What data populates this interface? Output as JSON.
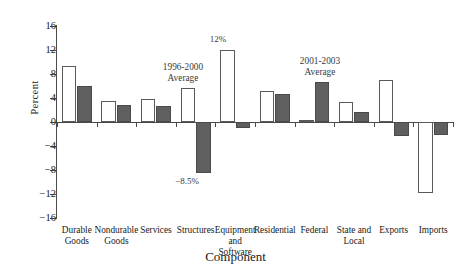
{
  "chart_data": {
    "type": "bar",
    "title": "",
    "xlabel": "Component",
    "ylabel": "Percent",
    "ylim": [
      -16,
      16
    ],
    "yticks": [
      16,
      12,
      8,
      4,
      0,
      -4,
      -8,
      -12,
      -16
    ],
    "ytick_labels": [
      "16",
      "12",
      "8",
      "4",
      "0",
      "−4",
      "−8",
      "−12",
      "−16"
    ],
    "grid": false,
    "legend": "none (series identified by in-plot annotations)",
    "categories": [
      "Durable Goods",
      "Nondurable Goods",
      "Services",
      "Structures",
      "Equipment and Software",
      "Residential",
      "Federal",
      "State and Local",
      "Exports",
      "Imports"
    ],
    "category_lines": [
      [
        "Durable",
        "Goods"
      ],
      [
        "Nondurable",
        "Goods"
      ],
      [
        "Services"
      ],
      [
        "Structures"
      ],
      [
        "Equipment",
        "and",
        "Software"
      ],
      [
        "Residential"
      ],
      [
        "Federal"
      ],
      [
        "State and",
        "Local"
      ],
      [
        "Exports"
      ],
      [
        "Imports"
      ]
    ],
    "series": [
      {
        "name": "1996-2000 Average",
        "style": "white-filled outlined bar",
        "color": "#ffffff",
        "edge_color": "#5a5a5a",
        "values": [
          9.3,
          3.5,
          3.9,
          5.6,
          12.0,
          5.2,
          0.3,
          3.4,
          7.0,
          -11.8
        ]
      },
      {
        "name": "2001-2003 Average",
        "style": "dark gray filled bar",
        "color": "#5f5f5f",
        "edge_color": "#4a4a4a",
        "values": [
          6.0,
          2.8,
          2.6,
          -8.5,
          -1.0,
          4.7,
          6.7,
          1.7,
          -2.4,
          -2.2
        ]
      }
    ],
    "annotations": [
      {
        "text_lines": [
          "1996-2000",
          "Average"
        ],
        "points_to": "Structures / 1996-2000 bar",
        "single_line": "1996-2000 Average"
      },
      {
        "text_lines": [
          "12%"
        ],
        "points_to": "Equipment and Software / 1996-2000 bar",
        "single_line": "12%"
      },
      {
        "text_lines": [
          "−8.5%"
        ],
        "points_to": "Structures / 2001-2003 bar",
        "single_line": "−8.5%"
      },
      {
        "text_lines": [
          "2001-2003",
          "Average"
        ],
        "points_to": "Federal / 2001-2003 bar",
        "single_line": "2001-2003 Average"
      }
    ]
  },
  "annotation_text": {
    "a1_line1": "1996-2000",
    "a1_line2": "Average",
    "a2": "12%",
    "a3": "−8.5%",
    "a4_line1": "2001-2003",
    "a4_line2": "Average"
  },
  "axis": {
    "y_title": "Percent",
    "x_title": "Component"
  },
  "ytick_labels": {
    "t0": "16",
    "t1": "12",
    "t2": "8",
    "t3": "4",
    "t4": "0",
    "t5": "−4",
    "t6": "−8",
    "t7": "−12",
    "t8": "−16"
  },
  "cats": {
    "c0l1": "Durable",
    "c0l2": "Goods",
    "c1l1": "Nondurable",
    "c1l2": "Goods",
    "c2l1": "Services",
    "c3l1": "Structures",
    "c4l1": "Equipment",
    "c4l2": "and",
    "c4l3": "Software",
    "c5l1": "Residential",
    "c6l1": "Federal",
    "c7l1": "State and",
    "c7l2": "Local",
    "c8l1": "Exports",
    "c9l1": "Imports"
  }
}
